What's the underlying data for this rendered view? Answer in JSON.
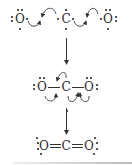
{
  "diagram": {
    "step1": {
      "label": "separate atoms",
      "atoms": [
        {
          "symbol": "O",
          "role": "left-oxygen"
        },
        {
          "symbol": "C",
          "role": "carbon"
        },
        {
          "symbol": "O",
          "role": "right-oxygen"
        }
      ]
    },
    "step2": {
      "label": "single bonds with curved arrows",
      "atoms": [
        {
          "symbol": "O",
          "role": "left-oxygen"
        },
        {
          "symbol": "C",
          "role": "carbon"
        },
        {
          "symbol": "O",
          "role": "right-oxygen"
        }
      ]
    },
    "step3": {
      "label": "double bonds O=C=O",
      "atoms": [
        {
          "symbol": "O",
          "role": "left-oxygen"
        },
        {
          "symbol": "C",
          "role": "carbon"
        },
        {
          "symbol": "O",
          "role": "right-oxygen"
        }
      ]
    },
    "colors": {
      "ink": "#2a2a2a",
      "background": "#ffffff"
    }
  }
}
